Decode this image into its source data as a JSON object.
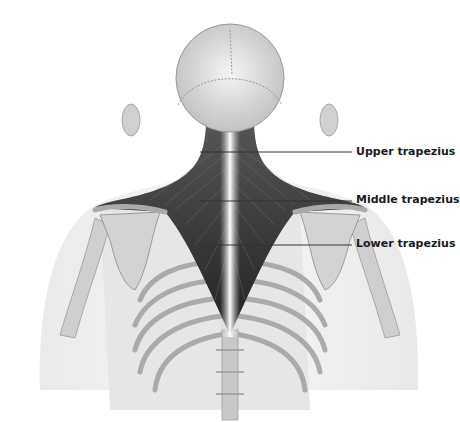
{
  "figure": {
    "labels": [
      {
        "text": "Upper trapezius",
        "x": 356,
        "y": 145,
        "line_from_x": 200,
        "line_y": 152
      },
      {
        "text": "Middle trapezius",
        "x": 356,
        "y": 193,
        "line_from_x": 200,
        "line_y": 201
      },
      {
        "text": "Lower trapezius",
        "x": 356,
        "y": 237,
        "line_from_x": 200,
        "line_y": 245
      }
    ]
  }
}
